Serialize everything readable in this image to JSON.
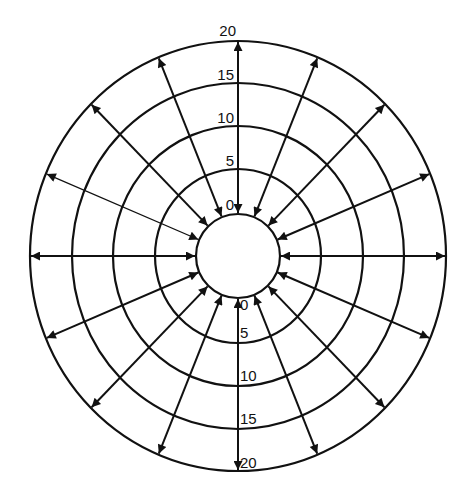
{
  "diagram": {
    "center": [
      238,
      256
    ],
    "rings": [
      {
        "rx": 42,
        "ry": 42
      },
      {
        "rx": 83,
        "ry": 87
      },
      {
        "rx": 125,
        "ry": 130
      },
      {
        "rx": 166,
        "ry": 173
      },
      {
        "rx": 208,
        "ry": 215
      }
    ],
    "arrow_count": 16,
    "arrow_angle_step_deg": 22.5,
    "thin_arrow_angle_deg": 157.5,
    "stroke_color": "#111111",
    "top_scale": {
      "labels": [
        "20",
        "15",
        "10",
        "5",
        "0"
      ]
    },
    "bottom_scale": {
      "labels": [
        "0",
        "5",
        "10",
        "15",
        "20"
      ]
    }
  }
}
